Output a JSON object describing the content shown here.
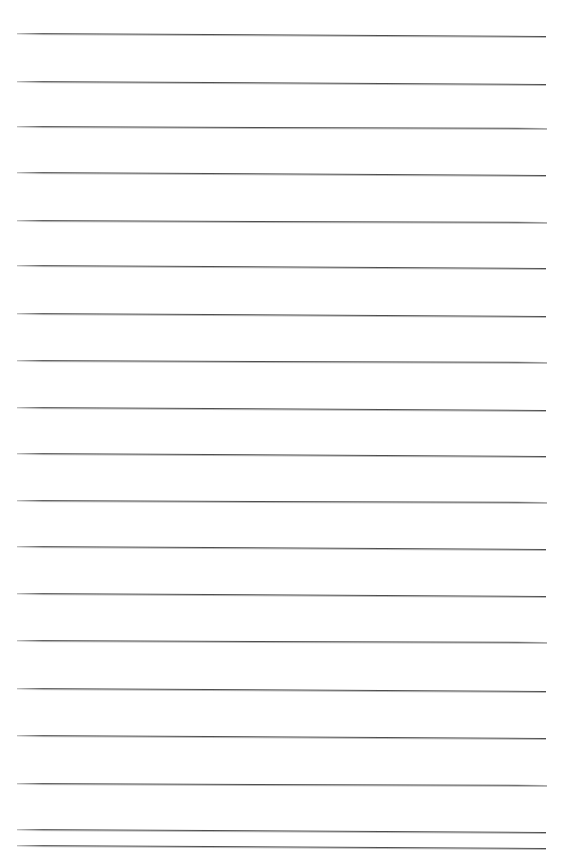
{
  "page": {
    "width_px": 562,
    "height_px": 852,
    "background_color": "#ffffff",
    "content_text": ""
  },
  "ruling": {
    "name": "horizontal-ruled-lines",
    "line_count": 18,
    "line_color": "#4f4f4f",
    "line_shadow_color": "#b9b9b9",
    "line_thickness_px": 1,
    "left_margin_px": 17,
    "right_margin_px": 546,
    "lines": [
      {
        "index": 1,
        "y": 33,
        "left": 17,
        "right": 546,
        "slope_px": 3
      },
      {
        "index": 2,
        "y": 81,
        "left": 17,
        "right": 546,
        "slope_px": 3
      },
      {
        "index": 3,
        "y": 126,
        "left": 17,
        "right": 547,
        "slope_px": 2
      },
      {
        "index": 4,
        "y": 172,
        "left": 17,
        "right": 546,
        "slope_px": 3
      },
      {
        "index": 5,
        "y": 220,
        "left": 17,
        "right": 547,
        "slope_px": 2
      },
      {
        "index": 6,
        "y": 265,
        "left": 17,
        "right": 546,
        "slope_px": 3
      },
      {
        "index": 7,
        "y": 313,
        "left": 17,
        "right": 546,
        "slope_px": 3
      },
      {
        "index": 8,
        "y": 360,
        "left": 17,
        "right": 547,
        "slope_px": 2
      },
      {
        "index": 9,
        "y": 407,
        "left": 17,
        "right": 546,
        "slope_px": 3
      },
      {
        "index": 10,
        "y": 453,
        "left": 17,
        "right": 546,
        "slope_px": 3
      },
      {
        "index": 11,
        "y": 500,
        "left": 17,
        "right": 547,
        "slope_px": 2
      },
      {
        "index": 12,
        "y": 546,
        "left": 17,
        "right": 546,
        "slope_px": 3
      },
      {
        "index": 13,
        "y": 593,
        "left": 17,
        "right": 546,
        "slope_px": 3
      },
      {
        "index": 14,
        "y": 640,
        "left": 17,
        "right": 547,
        "slope_px": 2
      },
      {
        "index": 15,
        "y": 688,
        "left": 17,
        "right": 546,
        "slope_px": 3
      },
      {
        "index": 16,
        "y": 735,
        "left": 17,
        "right": 546,
        "slope_px": 3
      },
      {
        "index": 17,
        "y": 783,
        "left": 17,
        "right": 547,
        "slope_px": 2
      },
      {
        "index": 18,
        "y": 829,
        "left": 17,
        "right": 546,
        "slope_px": 3
      },
      {
        "index": 19,
        "y": 845,
        "left": 17,
        "right": 546,
        "slope_px": 3
      }
    ]
  }
}
